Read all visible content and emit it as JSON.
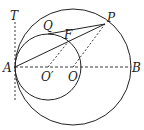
{
  "diagram": {
    "labels": {
      "T": "T",
      "Q": "Q",
      "P": "P",
      "F": "F",
      "A": "A",
      "O_prime": "O′",
      "O": "O",
      "B": "B"
    },
    "colors": {
      "stroke": "#222222",
      "background": "#ffffff"
    },
    "elements": {
      "big_circle": {
        "center": "O",
        "passes_through": [
          "A",
          "P",
          "B"
        ]
      },
      "small_circle": {
        "center": "O′",
        "passes_through": [
          "A",
          "Q",
          "F"
        ],
        "tangent_internally_at": "A"
      },
      "tangent_line": {
        "through": "A",
        "label": "T",
        "style": "dashed"
      },
      "diameter": {
        "from": "A",
        "to": "B",
        "style": "dashed"
      },
      "segments_solid": [
        "AP",
        "QP"
      ],
      "segments_dashed": [
        "O′F",
        "OP",
        "AB",
        "AT"
      ]
    }
  }
}
